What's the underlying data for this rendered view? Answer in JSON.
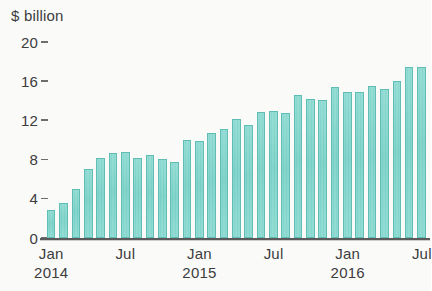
{
  "chart_data": {
    "type": "bar",
    "title": "$ billion",
    "xlabel": "",
    "ylabel": "$ billion",
    "ylim": [
      0,
      20
    ],
    "yticks": [
      0,
      4,
      8,
      12,
      16,
      20
    ],
    "ytick_labels": [
      "0",
      "4",
      "8",
      "12",
      "16",
      "20"
    ],
    "grid": false,
    "legend": null,
    "bar_color": "#7ed3c9",
    "bar_edge_color": "#5fbdb3",
    "axis_color": "#5b5b5b",
    "text_color": "#3c3c3c",
    "x_tick_labels": [
      {
        "month": "Jan",
        "year": "2014",
        "index": 0
      },
      {
        "month": "Jul",
        "year": "",
        "index": 6
      },
      {
        "month": "Jan",
        "year": "2015",
        "index": 12
      },
      {
        "month": "Jul",
        "year": "",
        "index": 18
      },
      {
        "month": "Jan",
        "year": "2016",
        "index": 24
      },
      {
        "month": "Jul",
        "year": "",
        "index": 30
      }
    ],
    "categories": [
      "Jan 2014",
      "Feb 2014",
      "Mar 2014",
      "Apr 2014",
      "May 2014",
      "Jun 2014",
      "Jul 2014",
      "Aug 2014",
      "Sep 2014",
      "Oct 2014",
      "Nov 2014",
      "Dec 2014",
      "Jan 2015",
      "Feb 2015",
      "Mar 2015",
      "Apr 2015",
      "May 2015",
      "Jun 2015",
      "Jul 2015",
      "Aug 2015",
      "Sep 2015",
      "Oct 2015",
      "Nov 2015",
      "Dec 2015",
      "Jan 2016",
      "Feb 2016",
      "Mar 2016",
      "Apr 2016",
      "May 2016",
      "Jun 2016",
      "Jul 2016"
    ],
    "values": [
      2.9,
      3.6,
      5.0,
      7.0,
      8.2,
      8.7,
      8.8,
      8.2,
      8.5,
      8.1,
      7.8,
      10.0,
      9.9,
      10.7,
      11.1,
      12.1,
      11.5,
      12.9,
      13.0,
      12.8,
      14.6,
      14.2,
      14.1,
      15.4,
      14.9,
      14.9,
      15.5,
      15.2,
      16.0,
      17.5,
      17.4
    ]
  }
}
